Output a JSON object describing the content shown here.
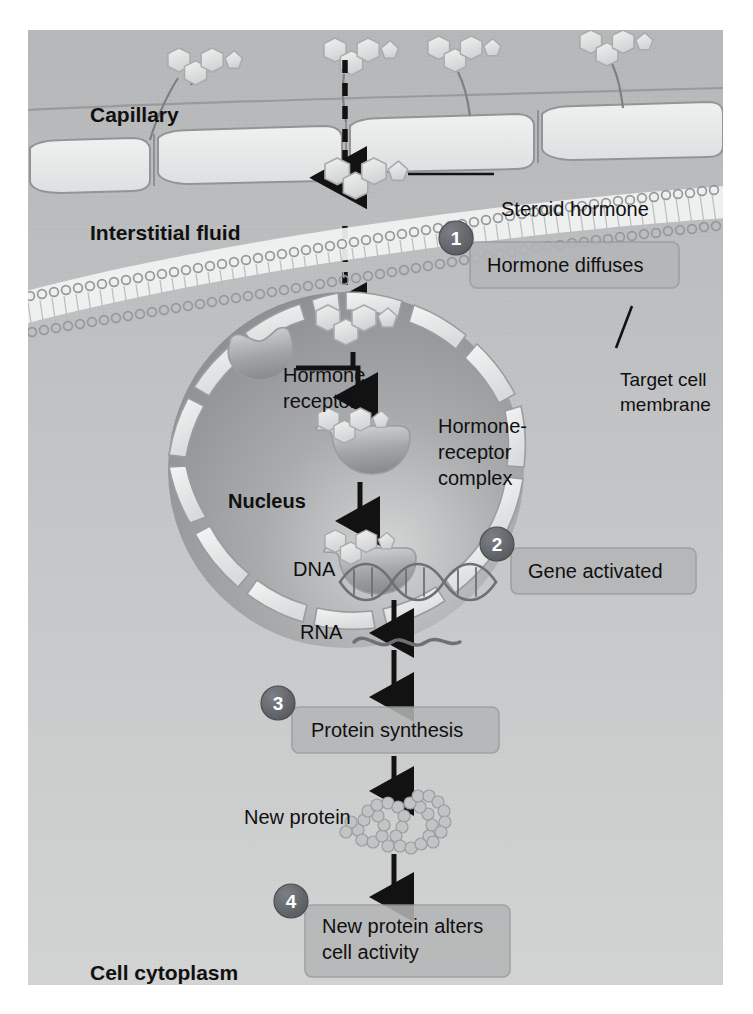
{
  "figure": {
    "type": "biology-diagram",
    "background_color": "#c3c4c6",
    "canvas": {
      "x": 28,
      "y": 30,
      "width": 695,
      "height": 955
    }
  },
  "region_labels": [
    {
      "id": "capillary",
      "text": "Capillary",
      "x": 62,
      "y": 92,
      "bold": true,
      "size": 21
    },
    {
      "id": "interstitial-fluid",
      "text": "Interstitial fluid",
      "x": 62,
      "y": 210,
      "bold": true,
      "size": 21
    },
    {
      "id": "nucleus",
      "text": "Nucleus",
      "x": 200,
      "y": 478,
      "bold": true,
      "size": 20
    },
    {
      "id": "cell-cytoplasm",
      "text": "Cell cytoplasm",
      "x": 62,
      "y": 950,
      "bold": true,
      "size": 21
    }
  ],
  "structure_labels": [
    {
      "id": "steroid-hormone",
      "text": "Steroid hormone",
      "x": 473,
      "y": 186,
      "size": 20,
      "anchor": "start"
    },
    {
      "id": "target-cell-membrane",
      "line1": "Target cell",
      "line2": "membrane",
      "x": 592,
      "y": 356,
      "size": 19,
      "anchor": "start"
    },
    {
      "id": "hormone-receptor",
      "line1": "Hormone",
      "line2": "receptor",
      "x": 255,
      "y": 352,
      "size": 20,
      "anchor": "start"
    },
    {
      "id": "hormone-receptor-complex",
      "line1": "Hormone-",
      "line2": "receptor",
      "line3": "complex",
      "x": 410,
      "y": 403,
      "size": 20,
      "anchor": "start"
    },
    {
      "id": "dna",
      "text": "DNA",
      "x": 265,
      "y": 546,
      "size": 20,
      "anchor": "start"
    },
    {
      "id": "rna",
      "text": "RNA",
      "x": 272,
      "y": 609,
      "size": 20,
      "anchor": "start"
    },
    {
      "id": "new-protein",
      "text": "New protein",
      "x": 216,
      "y": 794,
      "size": 20,
      "anchor": "start"
    }
  ],
  "steps": [
    {
      "number": "1",
      "label": "Hormone diffuses",
      "badge_x": 428,
      "badge_y": 208,
      "box_x": 442,
      "box_y": 212,
      "box_w": 209,
      "box_h": 46,
      "text_x": 459,
      "text_y": 242,
      "lines": 1
    },
    {
      "number": "2",
      "label": "Gene activated",
      "badge_x": 469,
      "badge_y": 514,
      "box_x": 483,
      "box_y": 518,
      "box_w": 185,
      "box_h": 46,
      "text_x": 500,
      "text_y": 548,
      "lines": 1
    },
    {
      "number": "3",
      "label": "Protein synthesis",
      "badge_x": 250,
      "badge_y": 673,
      "box_x": 264,
      "box_y": 677,
      "box_w": 207,
      "box_h": 46,
      "text_x": 283,
      "text_y": 707,
      "lines": 1
    },
    {
      "number": "4",
      "label": "New protein alters",
      "label2": "cell activity",
      "badge_x": 263,
      "badge_y": 871,
      "box_x": 277,
      "box_y": 875,
      "box_w": 205,
      "box_h": 72,
      "text_x": 294,
      "text_y": 903,
      "lines": 2
    }
  ],
  "colors": {
    "background_top": "#b8b9bb",
    "background_bottom": "#cfd0d1",
    "badge_fill": "#63676b",
    "badge_text": "#ffffff",
    "callout_fill": "#b4b5b6",
    "callout_stroke": "#9a9b9c",
    "hormone_fill": "#e4e5e6",
    "hormone_stroke": "#a9aaab",
    "nucleus_dark": "#8f9193",
    "nucleus_light": "#c8c9ca",
    "envelope_fill": "#eceded",
    "capillary_cell": "#e9eaea",
    "membrane_white": "#f2f3f3",
    "arrow_black": "#121212",
    "text_black": "#101010"
  },
  "diagram_flow": {
    "dashed_arrow_path": "hormone travels from capillary lumen down through interstitial fluid and target cell membrane into the nucleus",
    "solid_arrows": [
      "hormone receptor binds hormone to form hormone-receptor complex",
      "complex moves down to DNA",
      "DNA to RNA transcription",
      "RNA out of nucleus to protein synthesis",
      "protein synthesis to new protein",
      "new protein to cell activity"
    ]
  }
}
